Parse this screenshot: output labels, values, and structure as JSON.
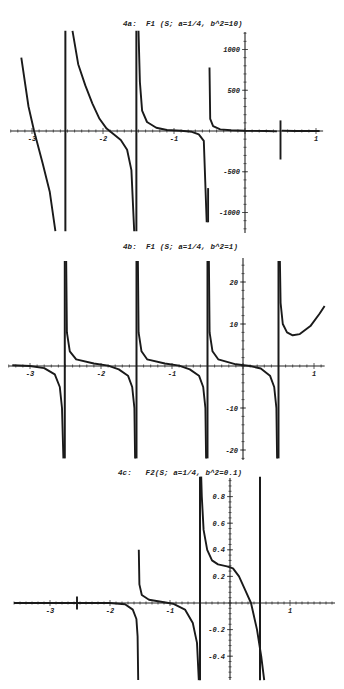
{
  "chart_data": [
    {
      "id": "4a",
      "type": "line",
      "title": "4a:  F1 (S; a=1/4, b^2=10)",
      "xlabel": "",
      "ylabel": "",
      "xlim": [
        -3.3,
        1.1
      ],
      "ylim": [
        -1250,
        1250
      ],
      "grid": false,
      "x_ticks": [
        -3,
        -2,
        -1,
        1
      ],
      "y_ticks": [
        1000,
        500,
        -500,
        -1000
      ],
      "layout": {
        "top": 0,
        "height": 240,
        "x0px": 245,
        "xscale": 71,
        "y0px": 131,
        "yscale": 0.0815,
        "ytop": 32,
        "ybot": 233
      },
      "asymptotes": [
        -2.53,
        -1.52,
        -0.52
      ],
      "series": [
        {
          "name": "branch-1",
          "points": [
            [
              -3.15,
              900
            ],
            [
              -3.05,
              300
            ],
            [
              -2.97,
              0
            ],
            [
              -2.85,
              -400
            ],
            [
              -2.75,
              -750
            ],
            [
              -2.67,
              -1230
            ]
          ]
        },
        {
          "name": "branch-2",
          "points": [
            [
              -2.43,
              1230
            ],
            [
              -2.35,
              820
            ],
            [
              -2.25,
              560
            ],
            [
              -2.15,
              340
            ],
            [
              -2.05,
              150
            ],
            [
              -1.95,
              30
            ],
            [
              -1.85,
              -40
            ],
            [
              -1.75,
              -110
            ],
            [
              -1.66,
              -230
            ],
            [
              -1.6,
              -480
            ],
            [
              -1.56,
              -1230
            ]
          ]
        },
        {
          "name": "branch-3",
          "points": [
            [
              -1.5,
              1230
            ],
            [
              -1.48,
              600
            ],
            [
              -1.45,
              250
            ],
            [
              -1.38,
              110
            ],
            [
              -1.25,
              40
            ],
            [
              -1.1,
              12
            ],
            [
              -0.9,
              3
            ],
            [
              -0.75,
              -10
            ],
            [
              -0.65,
              -40
            ],
            [
              -0.58,
              -120
            ],
            [
              -0.54,
              -1120
            ]
          ]
        },
        {
          "name": "spike-3",
          "points": [
            [
              -0.52,
              -1120
            ],
            [
              -0.52,
              -700
            ]
          ]
        },
        {
          "name": "branch-4",
          "points": [
            [
              -0.5,
              780
            ],
            [
              -0.49,
              150
            ],
            [
              -0.45,
              60
            ],
            [
              -0.35,
              20
            ],
            [
              -0.2,
              8
            ],
            [
              0,
              3
            ],
            [
              0.3,
              0
            ],
            [
              0.45,
              -5
            ]
          ]
        },
        {
          "name": "spike-5",
          "points": [
            [
              0.5,
              130
            ],
            [
              0.5,
              -350
            ]
          ]
        },
        {
          "name": "branch-5",
          "points": [
            [
              0.52,
              5
            ],
            [
              0.7,
              0
            ],
            [
              1.05,
              0
            ]
          ]
        }
      ],
      "asymptote_lines": [
        {
          "x": -2.53,
          "ytop": 1230,
          "ybot": -1230
        },
        {
          "x": -1.53,
          "ytop": 1230,
          "ybot": -1230
        }
      ]
    },
    {
      "id": "4b",
      "type": "line",
      "title": "4b:  F1 (S; a=1/4, b^2=1)",
      "xlabel": "",
      "ylabel": "",
      "xlim": [
        -3.3,
        1.15
      ],
      "ylim": [
        -22,
        25
      ],
      "grid": false,
      "x_ticks": [
        -3,
        -2,
        -1,
        1
      ],
      "y_ticks": [
        20,
        10,
        -10,
        -20
      ],
      "layout": {
        "top": 0,
        "height": 240,
        "x0px": 243,
        "xscale": 71,
        "y0px": 366,
        "yscale": 4.2,
        "ytop": 258,
        "ybot": 460
      },
      "series": [
        {
          "name": "branch-1",
          "points": [
            [
              -3.25,
              0.2
            ],
            [
              -3.0,
              0
            ],
            [
              -2.8,
              -0.5
            ],
            [
              -2.65,
              -2
            ],
            [
              -2.58,
              -5
            ],
            [
              -2.55,
              -10
            ],
            [
              -2.53,
              -22
            ]
          ]
        },
        {
          "name": "branch-2",
          "points": [
            [
              -2.49,
              25
            ],
            [
              -2.48,
              8
            ],
            [
              -2.44,
              3.5
            ],
            [
              -2.35,
              1.6
            ],
            [
              -2.1,
              0.6
            ],
            [
              -1.9,
              0.1
            ],
            [
              -1.75,
              -0.8
            ],
            [
              -1.62,
              -2.3
            ],
            [
              -1.56,
              -5
            ],
            [
              -1.53,
              -10
            ],
            [
              -1.52,
              -22
            ]
          ]
        },
        {
          "name": "branch-3",
          "points": [
            [
              -1.48,
              25
            ],
            [
              -1.47,
              8
            ],
            [
              -1.43,
              3.5
            ],
            [
              -1.35,
              1.6
            ],
            [
              -1.1,
              0.6
            ],
            [
              -0.9,
              0.1
            ],
            [
              -0.75,
              -0.8
            ],
            [
              -0.62,
              -2.3
            ],
            [
              -0.56,
              -5
            ],
            [
              -0.53,
              -10
            ],
            [
              -0.52,
              -22
            ]
          ]
        },
        {
          "name": "branch-4",
          "points": [
            [
              -0.48,
              25
            ],
            [
              -0.47,
              8
            ],
            [
              -0.43,
              3.5
            ],
            [
              -0.35,
              1.6
            ],
            [
              -0.1,
              0.4
            ],
            [
              0.1,
              0
            ],
            [
              0.25,
              -0.6
            ],
            [
              0.38,
              -2.3
            ],
            [
              0.44,
              -5
            ],
            [
              0.47,
              -10
            ],
            [
              0.48,
              -22
            ]
          ]
        },
        {
          "name": "branch-5",
          "points": [
            [
              0.52,
              25
            ],
            [
              0.53,
              15
            ],
            [
              0.56,
              10
            ],
            [
              0.62,
              8
            ],
            [
              0.7,
              7.3
            ],
            [
              0.8,
              7.6
            ],
            [
              0.95,
              9.5
            ],
            [
              1.08,
              12.5
            ],
            [
              1.15,
              14.3
            ]
          ]
        }
      ],
      "asymptote_lines": [
        {
          "x": -2.51,
          "ytop": 25,
          "ybot": -22
        },
        {
          "x": -1.5,
          "ytop": 25,
          "ybot": -22
        },
        {
          "x": -0.5,
          "ytop": 25,
          "ybot": -22
        },
        {
          "x": 0.5,
          "ytop": 25,
          "ybot": -22
        }
      ]
    },
    {
      "id": "4c",
      "type": "line",
      "title": "4c:   F2(S; a=1/4, b^2=0.1)",
      "xlabel": "",
      "ylabel": "",
      "xlim": [
        -3.6,
        1.75
      ],
      "ylim": [
        -0.58,
        0.95
      ],
      "grid": false,
      "x_ticks": [
        -3,
        -2,
        -1,
        1
      ],
      "y_ticks": [
        0.8,
        0.6,
        0.4,
        0.2,
        -0.2,
        -0.4
      ],
      "layout": {
        "top": 0,
        "height": 220,
        "x0px": 230,
        "xscale": 60,
        "y0px": 603,
        "yscale": 133,
        "ytop": 478,
        "ybot": 680
      },
      "series": [
        {
          "name": "glitch",
          "points": [
            [
              -2.55,
              0.05
            ],
            [
              -2.55,
              -0.05
            ]
          ]
        },
        {
          "name": "branch-1",
          "points": [
            [
              -3.6,
              0
            ],
            [
              -2.0,
              0
            ],
            [
              -1.75,
              -0.01
            ],
            [
              -1.62,
              -0.05
            ],
            [
              -1.56,
              -0.12
            ],
            [
              -1.54,
              -0.25
            ],
            [
              -1.53,
              -0.58
            ]
          ]
        },
        {
          "name": "branch-2",
          "points": [
            [
              -1.52,
              0.4
            ],
            [
              -1.51,
              0.14
            ],
            [
              -1.47,
              0.06
            ],
            [
              -1.35,
              0.025
            ],
            [
              -1.15,
              0.01
            ],
            [
              -0.95,
              -0.005
            ],
            [
              -0.75,
              -0.05
            ],
            [
              -0.62,
              -0.15
            ],
            [
              -0.55,
              -0.3
            ],
            [
              -0.52,
              -0.58
            ]
          ]
        },
        {
          "name": "branch-3",
          "points": [
            [
              -0.48,
              0.95
            ],
            [
              -0.47,
              0.8
            ],
            [
              -0.44,
              0.55
            ],
            [
              -0.38,
              0.4
            ],
            [
              -0.3,
              0.32
            ],
            [
              -0.2,
              0.29
            ],
            [
              -0.05,
              0.275
            ],
            [
              0.05,
              0.26
            ],
            [
              0.15,
              0.2
            ],
            [
              0.25,
              0.1
            ],
            [
              0.35,
              0
            ],
            [
              0.45,
              -0.2
            ],
            [
              0.52,
              -0.4
            ],
            [
              0.57,
              -0.58
            ]
          ]
        }
      ],
      "asymptote_lines": [
        {
          "x": -0.5,
          "ytop": 0.95,
          "ybot": -0.58
        },
        {
          "x": 0.5,
          "ytop": 0.95,
          "ybot": -0.58
        }
      ]
    }
  ],
  "titles": {
    "a": "4a:  F1 (S; a=1/4, b^2=10)",
    "b": "4b:  F1 (S; a=1/4, b^2=1)",
    "c": "4c:   F2(S; a=1/4, b^2=0.1)"
  }
}
